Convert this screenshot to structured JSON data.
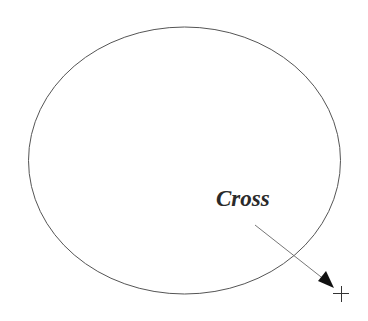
{
  "diagram": {
    "label": "Cross",
    "shapes": [
      {
        "type": "ellipse",
        "name": "outline-ellipse"
      },
      {
        "type": "arrow",
        "name": "pointer-arrow"
      },
      {
        "type": "cross",
        "name": "cross-marker"
      }
    ],
    "colors": {
      "ellipse_stroke": "#555555",
      "arrow_stroke": "#777777",
      "arrow_head": "#111111",
      "cross_stroke": "#333333",
      "text": "#2a2a2a"
    }
  }
}
